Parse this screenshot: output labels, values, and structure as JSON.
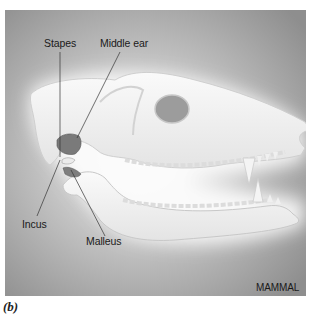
{
  "figure": {
    "caption": "(b)",
    "organism_label": "MAMMAL",
    "background_color": "#9a9a9a",
    "bone_color": "#f2f2f2",
    "ossicle_color": "#6e6e6e"
  },
  "labels": {
    "stapes": "Stapes",
    "middle_ear": "Middle ear",
    "incus": "Incus",
    "malleus": "Malleus"
  }
}
